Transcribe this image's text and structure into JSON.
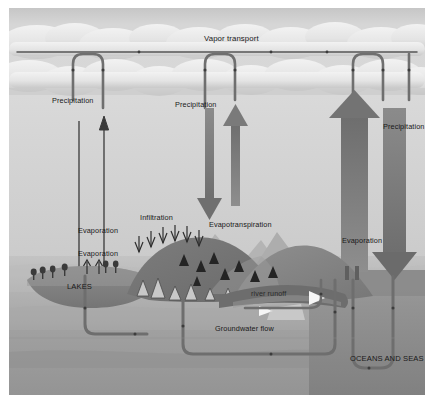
{
  "diagram": {
    "labels": {
      "vapor_transport": "Vapor transport",
      "precipitation_left": "Precipitation",
      "precipitation_center": "Precipitation",
      "precipitation_right": "Precipitation",
      "evaporation_left": "Evaporation",
      "evaporation_lake": "Evaporation",
      "evaporation_ocean": "Evaporation",
      "evapotranspiration": "Evapotranspiration",
      "infiltration": "Infiltration",
      "lakes": "LAKES",
      "river_runoff": "river runoff",
      "groundwater_flow": "Groundwater flow",
      "oceans_and_seas": "OCEANS AND SEAS"
    },
    "colors": {
      "sky": "#d2d2d2",
      "cloud_light": "#eeeeee",
      "cloud_shadow": "#b8b8b8",
      "ground_upper": "#c4c4c4",
      "ground_mid": "#b0b0b0",
      "ground_lower": "#9a9a9a",
      "ocean": "#8e8e8e",
      "mountain_dark": "#6e6e6e",
      "mountain_mid": "#8a8a8a",
      "lake": "#7e7e7e",
      "pipe": "#6a6a6a",
      "arrow_thin": "#3a3a3a",
      "arrow_thick": "#777777",
      "text": "#191919",
      "border": "#ffffff"
    },
    "icons": {
      "arrow_down": "arrow-down-icon",
      "arrow_up": "arrow-up-icon",
      "arrow_right": "arrow-right-icon",
      "cloud": "cloud-icon",
      "mountain": "mountain-icon",
      "tree": "tree-icon",
      "pipe": "pipe-icon"
    }
  }
}
